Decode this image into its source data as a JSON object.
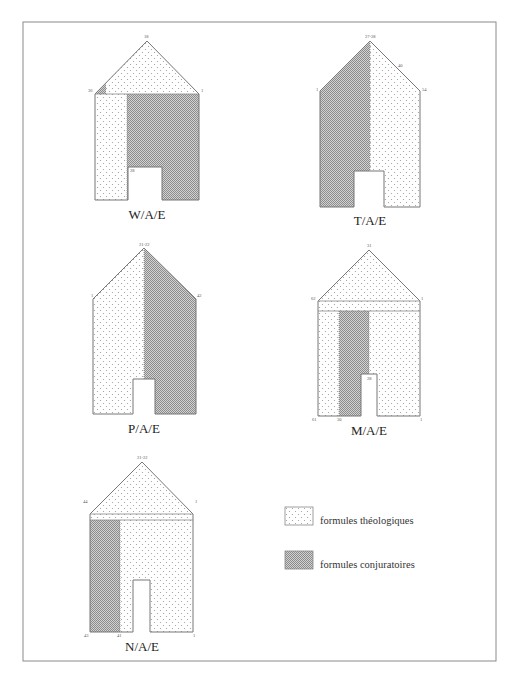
{
  "figure": {
    "frame_color": "#8a8a8a",
    "pattern_colors": {
      "dots": "#9a9a9a",
      "hatch": "#8c8c8c",
      "hatch_bg": "#cfcfcf"
    }
  },
  "diagrams": [
    {
      "id": "W/A/E",
      "caption": "W/A/E",
      "labels": {
        "apex": "18",
        "left_eave": "36",
        "right_eave": "1",
        "door_top": "28"
      }
    },
    {
      "id": "T/A/E",
      "caption": "T/A/E",
      "labels": {
        "apex": "27-28",
        "roof_mid": "40",
        "left_eave": "1",
        "right_eave": "54"
      }
    },
    {
      "id": "P/A/E",
      "caption": "P/A/E",
      "labels": {
        "apex": "21-22",
        "left_eave": "1",
        "right_eave": "42"
      }
    },
    {
      "id": "M/A/E",
      "caption": "M/A/E",
      "labels": {
        "apex": "31",
        "left_eave": "62",
        "right_eave": "1",
        "door_top": "28",
        "base_left": "61",
        "base_mid": "30",
        "base_right": "1"
      }
    },
    {
      "id": "N/A/E",
      "caption": "N/A/E",
      "labels": {
        "apex": "21-22",
        "left_eave": "44",
        "right_eave": "1",
        "base_left": "43",
        "base_mid": "41",
        "base_right": "1"
      }
    }
  ],
  "legend": {
    "items": [
      {
        "pattern": "dots",
        "label": "formules théologiques"
      },
      {
        "pattern": "hatch",
        "label": "formules conjuratoires"
      }
    ]
  }
}
